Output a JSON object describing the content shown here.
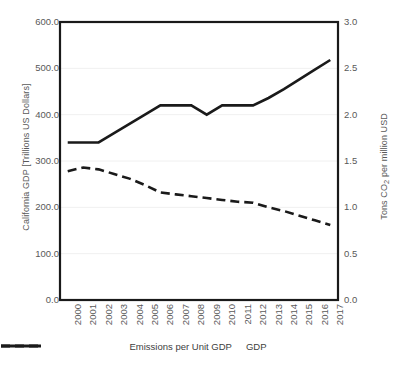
{
  "chart_data": {
    "type": "line",
    "title": "",
    "subtitle": "",
    "xlabel": "",
    "ylabel": "California GDP [Trillions US Dollars]",
    "y2label": "Tons CO₂ per million USD",
    "categories": [
      "2000",
      "2001",
      "2002",
      "2003",
      "2004",
      "2005",
      "2006",
      "2007",
      "2008",
      "2009",
      "2010",
      "2011",
      "2012",
      "2013",
      "2014",
      "2015",
      "2016",
      "2017"
    ],
    "x": [
      2000,
      2001,
      2002,
      2003,
      2004,
      2005,
      2006,
      2007,
      2008,
      2009,
      2010,
      2011,
      2012,
      2013,
      2014,
      2015,
      2016,
      2017
    ],
    "ylim": [
      0.0,
      600.0
    ],
    "y2lim": [
      0.0,
      3.0
    ],
    "yticks": [
      "600.0",
      "500.0",
      "400.0",
      "300.0",
      "200.0",
      "100.0",
      "0.0"
    ],
    "ytick_values": [
      600.0,
      500.0,
      400.0,
      300.0,
      200.0,
      100.0,
      0.0
    ],
    "y2ticks": [
      "3.0",
      "2.5",
      "2.0",
      "1.5",
      "1.0",
      "0.5",
      "0.0"
    ],
    "y2tick_values": [
      3.0,
      2.5,
      2.0,
      1.5,
      1.0,
      0.5,
      0.0
    ],
    "grid": true,
    "grid_axis": "y",
    "legend_position": "bottom",
    "series": [
      {
        "name": "Emissions per Unit GDP",
        "axis": "right",
        "style": "dashed",
        "color": "#1a1a1a",
        "values": [
          1.39,
          1.43,
          1.41,
          1.36,
          1.31,
          1.24,
          1.16,
          1.14,
          1.12,
          1.1,
          1.08,
          1.06,
          1.05,
          1.0,
          0.96,
          0.91,
          0.86,
          0.81
        ]
      },
      {
        "name": "GDP",
        "axis": "left",
        "style": "solid",
        "color": "#1a1a1a",
        "values": [
          340,
          340,
          340,
          360,
          380,
          400,
          420,
          420,
          420,
          400,
          420,
          420,
          420,
          436,
          455,
          476,
          497,
          518
        ]
      }
    ]
  },
  "legend": {
    "items": [
      {
        "label": "Emissions per Unit GDP",
        "style": "dashed",
        "color": "#1a1a1a"
      },
      {
        "label": "GDP",
        "style": "solid",
        "color": "#1a1a1a"
      }
    ]
  },
  "colors": {
    "plot_border": "#1a1a1a",
    "gridline": "#f0f0f0",
    "tick_text": "#595959",
    "series_line": "#1a1a1a",
    "background": "#ffffff"
  }
}
